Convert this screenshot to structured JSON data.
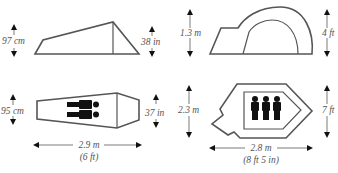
{
  "panels": {
    "tent1_side": {
      "height_metric": "97 cm",
      "height_imperial": "38 in"
    },
    "tent1_floor": {
      "width_metric": "95 cm",
      "width_imperial": "37 in",
      "length_metric": "2.9 m",
      "length_imperial": "(6 ft)",
      "occupants": 2
    },
    "tent2_side": {
      "height_metric": "1.3 m",
      "height_imperial": "4 ft"
    },
    "tent2_floor": {
      "width_metric": "2.3 m",
      "width_imperial": "7 ft",
      "length_metric": "2.8 m",
      "length_imperial": "(8 ft 5 in)",
      "occupants": 3
    }
  },
  "colors": {
    "outline": "#555555",
    "text": "#555555",
    "person": "#111111"
  }
}
